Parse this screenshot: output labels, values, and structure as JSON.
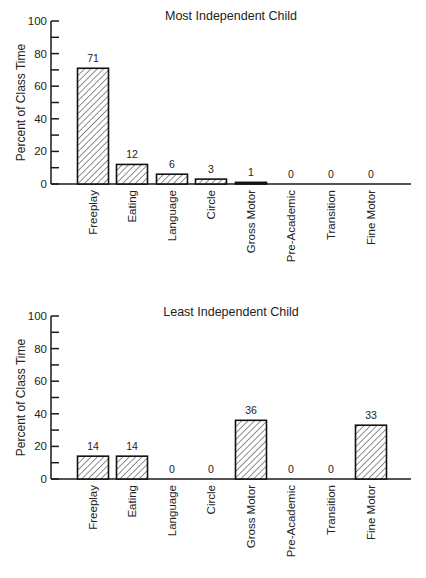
{
  "chart_data": [
    {
      "type": "bar",
      "title": "Most Independent Child",
      "xlabel": "",
      "ylabel": "Percent of Class Time",
      "ylim": [
        0,
        100
      ],
      "yticks": [
        0,
        20,
        40,
        60,
        80,
        100
      ],
      "grid": false,
      "legend": null,
      "pattern": "diagonal-hatch",
      "categories": [
        "Freeplay",
        "Eating",
        "Language",
        "Circle",
        "Gross Motor",
        "Pre-Academic",
        "Transition",
        "Fine Motor"
      ],
      "values": [
        71,
        12,
        6,
        3,
        1,
        0,
        0,
        0
      ],
      "data_labels": [
        "71",
        "12",
        "6",
        "3",
        "1",
        "0",
        "0",
        "0"
      ]
    },
    {
      "type": "bar",
      "title": "Least Independent Child",
      "xlabel": "",
      "ylabel": "Percent of Class Time",
      "ylim": [
        0,
        100
      ],
      "yticks": [
        0,
        20,
        40,
        60,
        80,
        100
      ],
      "grid": false,
      "legend": null,
      "pattern": "diagonal-hatch",
      "categories": [
        "Freeplay",
        "Eating",
        "Language",
        "Circle",
        "Gross Motor",
        "Pre-Academic",
        "Transition",
        "Fine Motor"
      ],
      "values": [
        14,
        14,
        0,
        0,
        36,
        0,
        0,
        33
      ],
      "data_labels": [
        "14",
        "14",
        "0",
        "0",
        "36",
        "0",
        "0",
        "33"
      ]
    }
  ],
  "colors": {
    "ink": "#1a1a1a",
    "background": "#ffffff"
  }
}
